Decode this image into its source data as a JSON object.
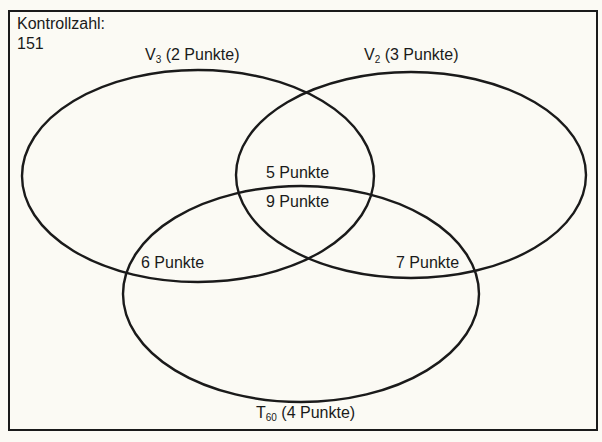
{
  "control": {
    "label": "Kontrollzahl:",
    "value": "151"
  },
  "sets": [
    {
      "id": "V3",
      "letter": "V",
      "subscript": "3",
      "points_label": "(2 Punkte)"
    },
    {
      "id": "V2",
      "letter": "V",
      "subscript": "2",
      "points_label": "(3 Punkte)"
    },
    {
      "id": "T60",
      "letter": "T",
      "subscript": "60",
      "points_label": "(4 Punkte)"
    }
  ],
  "regions": {
    "v3_v2": "5 Punkte",
    "v3_v2_t60": "9 Punkte",
    "v3_t60": "6 Punkte",
    "v2_t60": "7 Punkte"
  },
  "colors": {
    "ink": "#1a1a1a",
    "paper": "#fbfaf4"
  }
}
